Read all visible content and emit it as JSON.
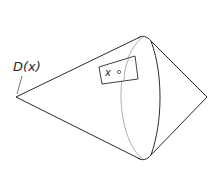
{
  "diagram": {
    "type": "double-cone",
    "labels": {
      "domain": "D(x)",
      "point": "x"
    },
    "colors": {
      "stroke": "#2a2a2a",
      "hidden_stroke": "#9a9a9a",
      "background": "#ffffff"
    }
  }
}
